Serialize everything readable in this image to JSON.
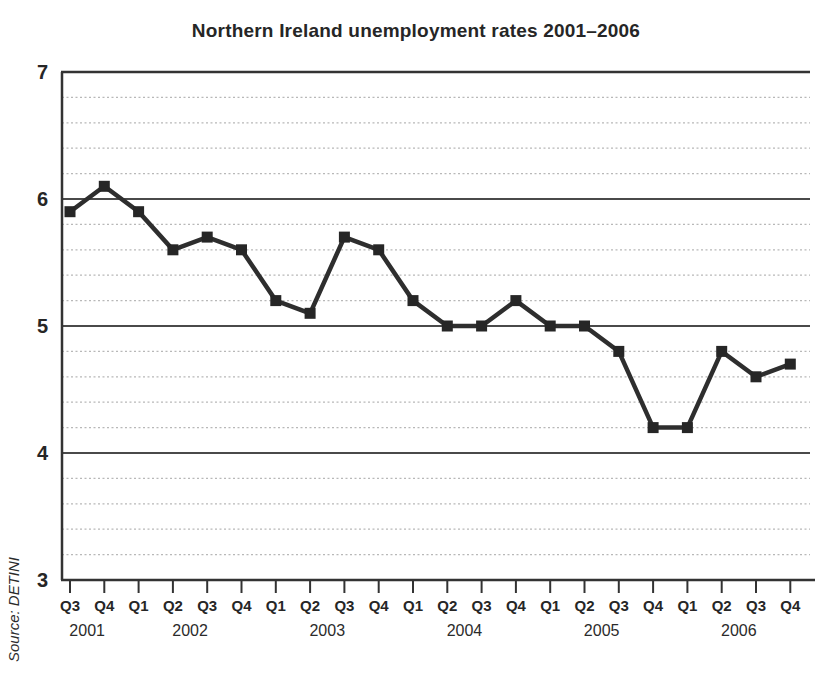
{
  "chart_data": {
    "type": "line",
    "title": "Northern Ireland unemployment rates 2001–2006",
    "source": "Source: DETINI",
    "categories": [
      "Q3",
      "Q4",
      "Q1",
      "Q2",
      "Q3",
      "Q4",
      "Q1",
      "Q2",
      "Q3",
      "Q4",
      "Q1",
      "Q2",
      "Q3",
      "Q4",
      "Q1",
      "Q2",
      "Q3",
      "Q4",
      "Q1",
      "Q2",
      "Q3",
      "Q4"
    ],
    "year_groups": [
      {
        "label": "2001",
        "quarters": 2
      },
      {
        "label": "2002",
        "quarters": 4
      },
      {
        "label": "2003",
        "quarters": 4
      },
      {
        "label": "2004",
        "quarters": 4
      },
      {
        "label": "2005",
        "quarters": 4
      },
      {
        "label": "2006",
        "quarters": 4
      }
    ],
    "values": [
      5.9,
      6.1,
      5.9,
      5.6,
      5.7,
      5.6,
      5.2,
      5.1,
      5.7,
      5.6,
      5.2,
      5.0,
      5.0,
      5.2,
      5.0,
      5.0,
      4.8,
      4.2,
      4.2,
      4.8,
      4.6,
      4.7
    ],
    "ylim": [
      3,
      7
    ],
    "y_major_ticks": [
      7,
      6,
      5,
      4,
      3
    ],
    "y_minor_step": 0.2,
    "legend": "none",
    "grid": "major-solid-minor-dotted",
    "marker": "square",
    "colors": {
      "line": "#2e2e2e",
      "marker": "#262626",
      "major_grid": "#4a4a4a",
      "minor_grid": "#b8b8b8",
      "axis": "#333333",
      "text": "#262626"
    }
  }
}
